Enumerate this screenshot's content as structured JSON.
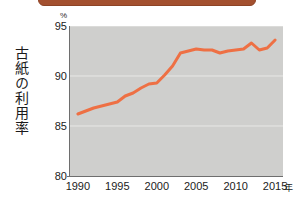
{
  "banner": {
    "text": ""
  },
  "axis_caption_vertical": "古紙の利用率",
  "unit_label": "%",
  "x_unit_label": "年",
  "chart_data": {
    "type": "line",
    "title": "",
    "subtitle": "",
    "xlabel": "年",
    "ylabel": "古紙の利用率",
    "unit": "%",
    "xlim": [
      1989,
      2016
    ],
    "ylim": [
      80,
      95
    ],
    "yticks": [
      80,
      85,
      90,
      95
    ],
    "xticks": [
      1990,
      1995,
      2000,
      2005,
      2010,
      2015
    ],
    "grid": "horizontal",
    "grid_color": "#e8e8e6",
    "plot_background": "#cfcfcd",
    "line_color": "#ee7044",
    "line_width": 3,
    "legend": "none",
    "series": [
      {
        "name": "古紙の利用率",
        "x": [
          1990,
          1991,
          1992,
          1993,
          1994,
          1995,
          1996,
          1997,
          1998,
          1999,
          2000,
          2001,
          2002,
          2003,
          2004,
          2005,
          2006,
          2007,
          2008,
          2009,
          2010,
          2011,
          2012,
          2013,
          2014,
          2015
        ],
        "values": [
          86.2,
          86.5,
          86.8,
          87.0,
          87.2,
          87.4,
          88.0,
          88.3,
          88.8,
          89.2,
          89.3,
          90.1,
          91.0,
          92.3,
          92.5,
          92.7,
          92.6,
          92.6,
          92.3,
          92.5,
          92.6,
          92.7,
          93.3,
          92.6,
          92.8,
          93.6
        ]
      }
    ]
  }
}
